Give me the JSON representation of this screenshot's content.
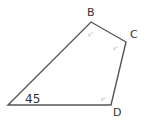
{
  "diagram": {
    "type": "quadrilateral",
    "stroke_color": "#555555",
    "vertices": [
      {
        "name": "A",
        "label": "",
        "x": 8,
        "y": 105
      },
      {
        "name": "B",
        "label": "B",
        "x": 91,
        "y": 22
      },
      {
        "name": "C",
        "label": "C",
        "x": 126,
        "y": 42
      },
      {
        "name": "D",
        "label": "D",
        "x": 111,
        "y": 105
      }
    ],
    "angles": {
      "A": "45",
      "B": "y°",
      "C": "x°",
      "D": "z°"
    }
  }
}
